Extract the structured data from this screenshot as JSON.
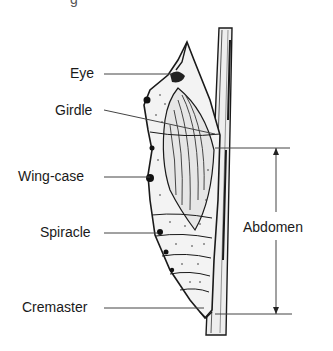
{
  "diagram": {
    "caption_fragment": "g",
    "labels": {
      "eye": "Eye",
      "girdle": "Girdle",
      "wing_case": "Wing-case",
      "spiracle": "Spiracle",
      "cremaster": "Cremaster",
      "abdomen": "Abdomen"
    },
    "colors": {
      "ink": "#1a1a1a",
      "line": "#444444",
      "paper": "#ffffff",
      "stipple": "#d8d8d8"
    }
  }
}
